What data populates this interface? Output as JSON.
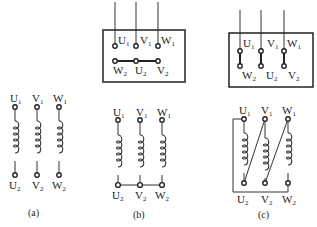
{
  "figure": {
    "panels": [
      {
        "id": "a",
        "caption": "(a)",
        "description": "Three separate motor windings, unconnected",
        "top_labels": [
          {
            "main": "U",
            "sub": "1"
          },
          {
            "main": "V",
            "sub": "1"
          },
          {
            "main": "W",
            "sub": "1"
          }
        ],
        "bottom_labels": [
          {
            "main": "U",
            "sub": "2"
          },
          {
            "main": "V",
            "sub": "2"
          },
          {
            "main": "W",
            "sub": "2"
          }
        ]
      },
      {
        "id": "b",
        "caption": "(b)",
        "description": "Star (Y) connection",
        "terminal_box": {
          "top_row": [
            {
              "main": "U",
              "sub": "1"
            },
            {
              "main": "V",
              "sub": "1"
            },
            {
              "main": "W",
              "sub": "1"
            }
          ],
          "bottom_row": [
            {
              "main": "W",
              "sub": "2"
            },
            {
              "main": "U",
              "sub": "2"
            },
            {
              "main": "V",
              "sub": "2"
            }
          ],
          "link": "horizontal bar joining W2-U2-V2"
        },
        "top_labels": [
          {
            "main": "U",
            "sub": "1"
          },
          {
            "main": "V",
            "sub": "1"
          },
          {
            "main": "W",
            "sub": "1"
          }
        ],
        "bottom_labels": [
          {
            "main": "U",
            "sub": "2"
          },
          {
            "main": "V",
            "sub": "2"
          },
          {
            "main": "W",
            "sub": "2"
          }
        ]
      },
      {
        "id": "c",
        "caption": "(c)",
        "description": "Delta (triangle) connection",
        "terminal_box": {
          "top_row": [
            {
              "main": "U",
              "sub": "1"
            },
            {
              "main": "V",
              "sub": "1"
            },
            {
              "main": "W",
              "sub": "1"
            }
          ],
          "bottom_row": [
            {
              "main": "W",
              "sub": "2"
            },
            {
              "main": "U",
              "sub": "2"
            },
            {
              "main": "V",
              "sub": "2"
            }
          ],
          "link": "vertical bars U1-W2, V1-U2, W1-V2"
        },
        "top_labels": [
          {
            "main": "U",
            "sub": "1"
          },
          {
            "main": "V",
            "sub": "1"
          },
          {
            "main": "W",
            "sub": "1"
          }
        ],
        "bottom_labels": [
          {
            "main": "U",
            "sub": "2"
          },
          {
            "main": "V",
            "sub": "2"
          },
          {
            "main": "W",
            "sub": "2"
          }
        ]
      }
    ]
  }
}
